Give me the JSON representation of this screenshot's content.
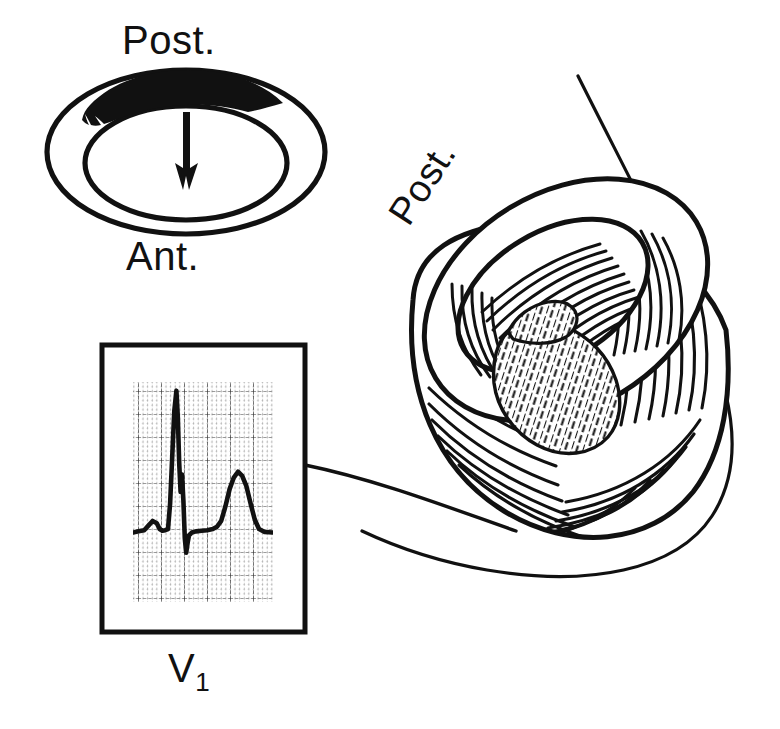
{
  "figure": {
    "background_color": "#ffffff",
    "ink_color": "#111111"
  },
  "ring_diagram": {
    "name": "short-axis-ventricle-ring",
    "posterior_label": "Post.",
    "anterior_label": "Ant.",
    "infarct_fill_color": "#111111",
    "infarct_location": "posterior",
    "arrow_direction": "downward",
    "arrow_meaning": "mean QRS vector directed away from posterior infarct"
  },
  "heart_diagram": {
    "name": "cutaway-ventricle",
    "posterior_label": "Post.",
    "infarct_pattern": "cross-hatch",
    "infarct_location": "posterior wall",
    "fiber_shading": "radiating line hatching"
  },
  "ecg_panel": {
    "name": "ecg-strip",
    "lead_label": "V",
    "lead_subscript": "1",
    "grid_color": "#555555",
    "trace_color": "#111111",
    "border_color": "#111111"
  },
  "chart_data": {
    "type": "line",
    "title": "V1",
    "xlabel": "",
    "ylabel": "",
    "grid": true,
    "legend": null,
    "xlim": [
      0,
      100
    ],
    "ylim": [
      -1.2,
      2.6
    ],
    "annotations": [
      "tall R wave",
      "notched R downstroke",
      "upright T wave"
    ],
    "series": [
      {
        "name": "V1",
        "x": [
          0,
          4,
          8,
          11,
          14,
          17,
          19,
          21,
          23,
          25,
          26.5,
          28,
          29.5,
          31,
          32,
          33,
          34,
          35,
          36,
          37,
          38,
          39,
          40,
          42,
          45,
          49,
          53,
          57,
          60,
          63,
          66,
          69,
          72,
          75,
          78,
          81,
          84,
          87,
          90,
          94,
          100
        ],
        "y": [
          0,
          0.02,
          0.04,
          0.12,
          0.2,
          0.16,
          0.06,
          0.03,
          0.04,
          0.06,
          0.5,
          1.3,
          2.1,
          2.45,
          2.0,
          1.2,
          0.7,
          1.0,
          0.55,
          -0.1,
          -0.35,
          -0.18,
          -0.05,
          0,
          0.02,
          0.03,
          0.04,
          0.06,
          0.1,
          0.2,
          0.45,
          0.75,
          0.95,
          1.05,
          0.98,
          0.8,
          0.5,
          0.22,
          0.06,
          0.01,
          0
        ]
      }
    ]
  },
  "leader_line": {
    "name": "ecg-to-heart-leader",
    "from": "ecg-panel-right-edge",
    "to": "heart-posterior-wall"
  }
}
